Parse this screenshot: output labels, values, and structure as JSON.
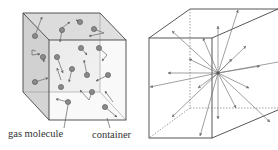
{
  "left_diagram": {
    "title": "Gas molecules in a container",
    "labels": {
      "molecule": "gas molecule",
      "container": "container"
    },
    "colors": {
      "shade": "#d9d9d9",
      "edge": "#444444",
      "molecule": "#8a8a8a",
      "arrow": "#666666"
    },
    "molecule_count": 17
  },
  "right_diagram": {
    "title": "Molecule velocities radiating in all directions",
    "arrow_count": 18,
    "colors": {
      "edge": "#444444",
      "arrow": "#777777"
    }
  }
}
